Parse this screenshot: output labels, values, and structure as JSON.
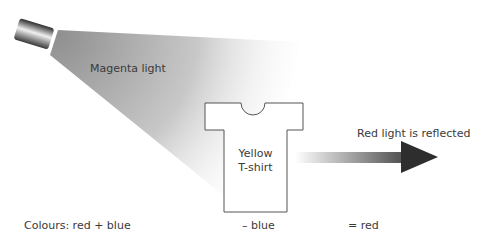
{
  "diagram": {
    "light_label": "Magenta light",
    "shirt_label_line1": "Yellow",
    "shirt_label_line2": "T-shirt",
    "reflected_label": "Red light is reflected",
    "equation": {
      "part1": "Colours: red + blue",
      "part2": "– blue",
      "part3": "= red"
    }
  },
  "colors": {
    "beam": "#9a9a9a",
    "arrow": "#3a3a3a",
    "outline": "#555555"
  }
}
